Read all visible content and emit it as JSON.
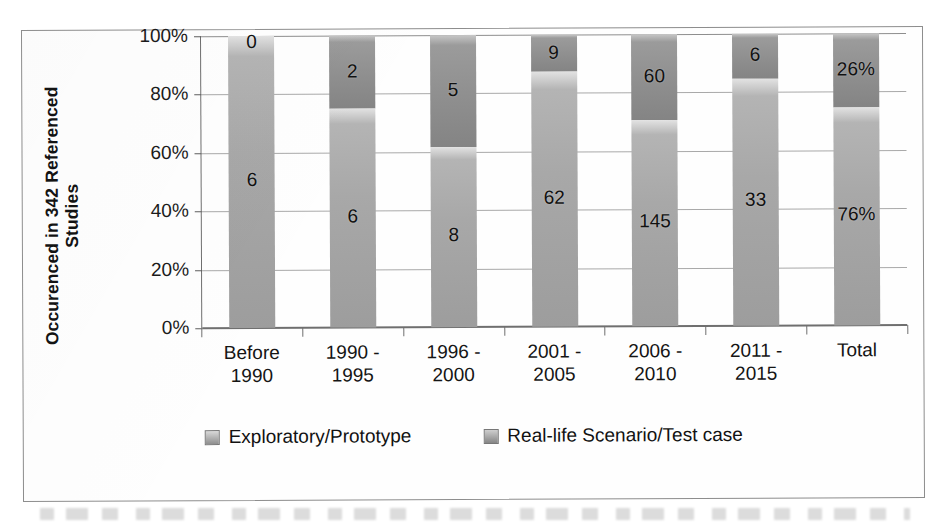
{
  "chart_data": {
    "type": "bar",
    "subtype": "100% stacked bar",
    "title": "",
    "xlabel": "",
    "ylabel": "Occurenced in 342 Referenced Studies",
    "ylabel_lines": [
      "Occurenced in 342 Referenced",
      "Studies"
    ],
    "ylim": [
      0,
      100
    ],
    "yticks": [
      "0%",
      "20%",
      "40%",
      "60%",
      "80%",
      "100%"
    ],
    "ytick_values": [
      0,
      20,
      40,
      60,
      80,
      100
    ],
    "grid": true,
    "legend_position": "bottom",
    "categories": [
      "Before\n1990",
      "1990 -\n1995",
      "1996 -\n2000",
      "2001 -\n2005",
      "2006 -\n2010",
      "2011 -\n2015",
      "Total"
    ],
    "series": [
      {
        "name": "Exploratory/Prototype",
        "color": "#a5a5a5",
        "labels": [
          "6",
          "6",
          "8",
          "62",
          "145",
          "33",
          "76%"
        ],
        "counts": [
          6,
          6,
          8,
          62,
          145,
          33,
          260
        ],
        "percents": [
          100,
          75,
          61.5,
          87.3,
          70.7,
          84.6,
          76
        ]
      },
      {
        "name": "Real-life Scenario/Test case",
        "color": "#8c8c8c",
        "labels": [
          "0",
          "2",
          "5",
          "9",
          "60",
          "6",
          "26%"
        ],
        "counts": [
          0,
          2,
          5,
          9,
          60,
          6,
          82
        ],
        "percents": [
          0,
          25,
          38.5,
          12.7,
          29.3,
          15.4,
          26
        ]
      }
    ]
  },
  "legend": {
    "items": [
      {
        "label": "Exploratory/Prototype",
        "swatch": "legend-swatch-exploratory"
      },
      {
        "label": "Real-life Scenario/Test case",
        "swatch": "legend-swatch-reallife"
      }
    ]
  }
}
